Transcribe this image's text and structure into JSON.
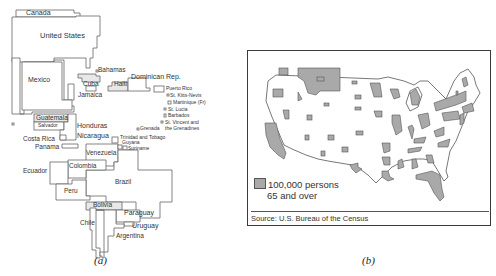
{
  "figure": {
    "panel_a": {
      "caption": "(a)",
      "countries": [
        {
          "name": "Canada",
          "x": 26,
          "y": 15,
          "size": 7
        },
        {
          "name": "United States",
          "x": 40,
          "y": 38,
          "size": 7.5
        },
        {
          "name": "Mexico",
          "x": 28,
          "y": 82,
          "size": 7
        },
        {
          "name": "Bahamas",
          "x": 98,
          "y": 72,
          "size": 6.5
        },
        {
          "name": "Cuba",
          "x": 83,
          "y": 86,
          "size": 6.5
        },
        {
          "name": "Dominican Rep.",
          "x": 131,
          "y": 79,
          "size": 7
        },
        {
          "name": "Haiti",
          "x": 114,
          "y": 86,
          "size": 6.5
        },
        {
          "name": "Jamaica",
          "x": 78,
          "y": 97,
          "size": 6.5
        },
        {
          "name": "Puerto Rico",
          "x": 166,
          "y": 90,
          "size": 5
        },
        {
          "name": "St. Kitts-Nevis",
          "x": 170,
          "y": 97,
          "size": 5
        },
        {
          "name": "Martinique (Fr)",
          "x": 173,
          "y": 104,
          "size": 5
        },
        {
          "name": "St. Lucia",
          "x": 168,
          "y": 111,
          "size": 5
        },
        {
          "name": "Barbados",
          "x": 168,
          "y": 117,
          "size": 5
        },
        {
          "name": "St. Vincent and",
          "x": 165,
          "y": 124,
          "size": 5
        },
        {
          "name": "the Grenadines",
          "x": 165,
          "y": 130,
          "size": 5
        },
        {
          "name": "Grenada",
          "x": 140,
          "y": 130,
          "size": 5
        },
        {
          "name": "Guatemala",
          "x": 36,
          "y": 120,
          "size": 6.5
        },
        {
          "name": "Salvador",
          "x": 38,
          "y": 127,
          "size": 5
        },
        {
          "name": "Honduras",
          "x": 77,
          "y": 128,
          "size": 7
        },
        {
          "name": "Nicaragua",
          "x": 77,
          "y": 138,
          "size": 7
        },
        {
          "name": "Costa Rica",
          "x": 23,
          "y": 141,
          "size": 6.5
        },
        {
          "name": "Panama",
          "x": 35,
          "y": 149,
          "size": 6.5
        },
        {
          "name": "Trinidad and Tobago",
          "x": 120,
          "y": 139,
          "size": 5
        },
        {
          "name": "Guyana",
          "x": 122,
          "y": 144,
          "size": 5
        },
        {
          "name": "Suriname",
          "x": 128,
          "y": 150,
          "size": 5
        },
        {
          "name": "Venezuela",
          "x": 86,
          "y": 155,
          "size": 6.5
        },
        {
          "name": "Colombia",
          "x": 69,
          "y": 168,
          "size": 6.5
        },
        {
          "name": "Ecuador",
          "x": 23,
          "y": 173,
          "size": 6.5
        },
        {
          "name": "Brazil",
          "x": 115,
          "y": 184,
          "size": 6.5
        },
        {
          "name": "Peru",
          "x": 64,
          "y": 193,
          "size": 6.5
        },
        {
          "name": "Bolivia",
          "x": 93,
          "y": 207,
          "size": 6.5
        },
        {
          "name": "Paraguay",
          "x": 124,
          "y": 215,
          "size": 7
        },
        {
          "name": "Chile",
          "x": 80,
          "y": 225,
          "size": 6.5
        },
        {
          "name": "Uruguay",
          "x": 132,
          "y": 228,
          "size": 7
        },
        {
          "name": "Argentina",
          "x": 116,
          "y": 238,
          "size": 6.5
        }
      ]
    },
    "panel_b": {
      "caption": "(b)",
      "legend_line1": "100,000 persons",
      "legend_line2": "65 and over",
      "source": "Source: U.S. Bureau of the Census",
      "symbol_color": "#a9a9a9"
    }
  }
}
